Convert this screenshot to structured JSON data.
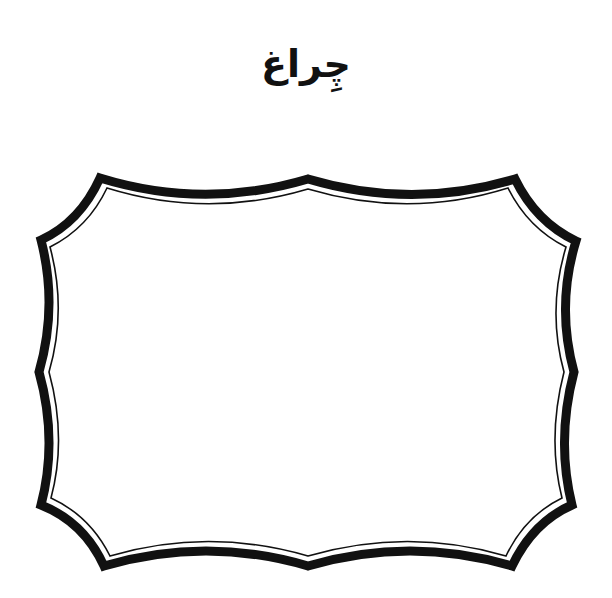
{
  "title": "چِراغ",
  "frame": {
    "shape": "scalloped-rectangle-label",
    "stroke_color": "#111111",
    "fill_color": "#ffffff"
  }
}
